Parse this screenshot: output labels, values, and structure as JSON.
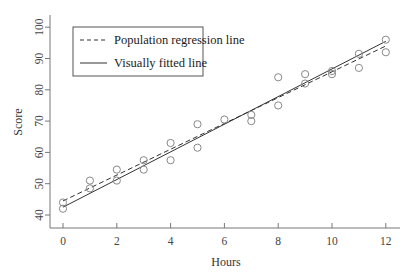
{
  "chart_data": {
    "type": "scatter",
    "title": "",
    "xlabel": "Hours",
    "ylabel": "Score",
    "xlim": [
      -0.5,
      12.5
    ],
    "ylim": [
      37.5,
      103
    ],
    "xticks": [
      0,
      2,
      4,
      6,
      8,
      10,
      12
    ],
    "yticks": [
      40,
      50,
      60,
      70,
      80,
      90,
      100
    ],
    "grid": false,
    "legend_position": "upper left",
    "series": [
      {
        "name": "Observed data",
        "kind": "scatter",
        "marker": "open-circle",
        "points": [
          [
            0,
            44
          ],
          [
            0,
            42
          ],
          [
            1,
            51
          ],
          [
            1,
            48.5
          ],
          [
            2,
            54.5
          ],
          [
            2,
            51
          ],
          [
            3,
            57.5
          ],
          [
            3,
            54.5
          ],
          [
            4,
            63
          ],
          [
            4,
            57.5
          ],
          [
            5,
            69
          ],
          [
            5,
            61.5
          ],
          [
            6,
            70.5
          ],
          [
            7,
            72
          ],
          [
            7,
            70
          ],
          [
            8,
            84
          ],
          [
            8,
            75
          ],
          [
            9,
            85
          ],
          [
            9,
            82
          ],
          [
            10,
            86
          ],
          [
            10,
            85
          ],
          [
            11,
            91.5
          ],
          [
            11,
            87
          ],
          [
            12,
            96
          ],
          [
            12,
            92
          ]
        ]
      },
      {
        "name": "Population regression line",
        "kind": "line",
        "style": "dashed",
        "x": [
          0,
          12
        ],
        "y": [
          44.5,
          94
        ]
      },
      {
        "name": "Visually fitted line",
        "kind": "line",
        "style": "solid",
        "x": [
          0,
          12
        ],
        "y": [
          42.5,
          95.5
        ]
      }
    ],
    "legend": [
      "Population regression line",
      "Visually fitted line"
    ]
  },
  "colors": {
    "axis": "#777777",
    "line": "#333333",
    "marker": "#888888",
    "background": "#ffffff"
  }
}
